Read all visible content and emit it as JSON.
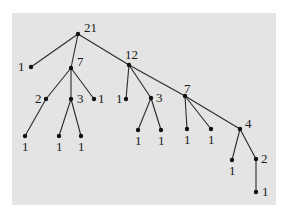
{
  "diagram": {
    "type": "tree",
    "colors": {
      "background": "#ffffff",
      "panel": "#e4e4e4",
      "ink": "#1a1a1a"
    },
    "nodes": [
      {
        "id": "n21",
        "label": "21",
        "x": 78,
        "y": 34,
        "lx": 84,
        "ly": 32
      },
      {
        "id": "n1a",
        "label": "1",
        "x": 31,
        "y": 67,
        "lx": 18,
        "ly": 71
      },
      {
        "id": "n7a",
        "label": "7",
        "x": 71,
        "y": 68,
        "lx": 77,
        "ly": 66
      },
      {
        "id": "n12",
        "label": "12",
        "x": 129,
        "y": 65,
        "lx": 125,
        "ly": 59
      },
      {
        "id": "n2a",
        "label": "2",
        "x": 46,
        "y": 99,
        "lx": 35,
        "ly": 103
      },
      {
        "id": "n3a",
        "label": "3",
        "x": 71,
        "y": 99,
        "lx": 77,
        "ly": 103
      },
      {
        "id": "n1b",
        "label": "1",
        "x": 94,
        "y": 99,
        "lx": 98,
        "ly": 103
      },
      {
        "id": "n1c",
        "label": "1",
        "x": 25,
        "y": 136,
        "lx": 22,
        "ly": 151
      },
      {
        "id": "n1d",
        "label": "1",
        "x": 59,
        "y": 136,
        "lx": 56,
        "ly": 151
      },
      {
        "id": "n1e",
        "label": "1",
        "x": 81,
        "y": 136,
        "lx": 78,
        "ly": 151
      },
      {
        "id": "n1f",
        "label": "1",
        "x": 126,
        "y": 99,
        "lx": 116,
        "ly": 103
      },
      {
        "id": "n3b",
        "label": "3",
        "x": 151,
        "y": 98,
        "lx": 156,
        "ly": 102
      },
      {
        "id": "n7b",
        "label": "7",
        "x": 185,
        "y": 96,
        "lx": 184,
        "ly": 93
      },
      {
        "id": "n1g",
        "label": "1",
        "x": 138,
        "y": 130,
        "lx": 135,
        "ly": 145
      },
      {
        "id": "n1h",
        "label": "1",
        "x": 161,
        "y": 130,
        "lx": 158,
        "ly": 145
      },
      {
        "id": "n1i",
        "label": "1",
        "x": 187,
        "y": 129,
        "lx": 184,
        "ly": 144
      },
      {
        "id": "n1j",
        "label": "1",
        "x": 211,
        "y": 129,
        "lx": 208,
        "ly": 144
      },
      {
        "id": "n4",
        "label": "4",
        "x": 240,
        "y": 129,
        "lx": 245,
        "ly": 128
      },
      {
        "id": "n1k",
        "label": "1",
        "x": 232,
        "y": 160,
        "lx": 229,
        "ly": 175
      },
      {
        "id": "n2b",
        "label": "2",
        "x": 256,
        "y": 159,
        "lx": 261,
        "ly": 163
      },
      {
        "id": "n1l",
        "label": "1",
        "x": 256,
        "y": 192,
        "lx": 262,
        "ly": 196
      }
    ],
    "edges": [
      [
        "n21",
        "n1a"
      ],
      [
        "n21",
        "n7a"
      ],
      [
        "n21",
        "n12"
      ],
      [
        "n7a",
        "n2a"
      ],
      [
        "n7a",
        "n3a"
      ],
      [
        "n7a",
        "n1b"
      ],
      [
        "n2a",
        "n1c"
      ],
      [
        "n3a",
        "n1d"
      ],
      [
        "n3a",
        "n1e"
      ],
      [
        "n12",
        "n1f"
      ],
      [
        "n12",
        "n3b"
      ],
      [
        "n12",
        "n7b"
      ],
      [
        "n3b",
        "n1g"
      ],
      [
        "n3b",
        "n1h"
      ],
      [
        "n7b",
        "n1i"
      ],
      [
        "n7b",
        "n1j"
      ],
      [
        "n7b",
        "n4"
      ],
      [
        "n4",
        "n1k"
      ],
      [
        "n4",
        "n2b"
      ],
      [
        "n2b",
        "n1l"
      ]
    ]
  }
}
